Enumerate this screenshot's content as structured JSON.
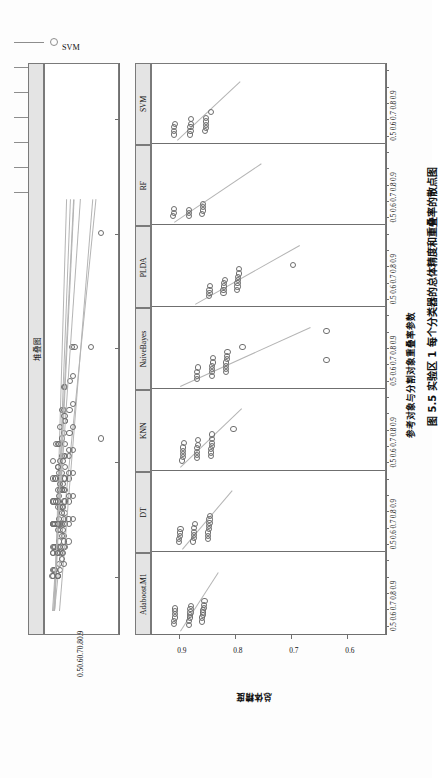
{
  "figure": {
    "caption": "图 5.5  实验区 1 每个分类器的总体精度和重叠率的散点图",
    "xlabel": "参考对象与分割对象重叠率参数",
    "ylabel": "总体精度"
  },
  "legend": {
    "title": "图例",
    "items": [
      {
        "label": "Adaboost.M1",
        "color": "#8d8d8d"
      },
      {
        "label": "DT",
        "color": "#8d8d8d"
      },
      {
        "label": "KNN",
        "color": "#8d8d8d"
      },
      {
        "label": "NaiveBayes",
        "color": "#8d8d8d"
      },
      {
        "label": "PLDA",
        "color": "#8d8d8d"
      },
      {
        "label": "RF",
        "color": "#8d8d8d"
      },
      {
        "label": "SVM",
        "color": "#8d8d8d"
      }
    ]
  },
  "top_panel": {
    "strip_label": "堆叠图",
    "axis_ticks": [
      "0.5",
      "0.6",
      "0.7",
      "0.8",
      "0.9"
    ]
  },
  "main_panel": {
    "strip_labels": [
      "Adaboost.M1",
      "DT",
      "KNN",
      "NaiveBayes",
      "PLDA",
      "RF",
      "SVM"
    ],
    "group_tick_text": "0.50.60.70.80.9",
    "y_ticks": [
      "0.9",
      "0.8",
      "0.7",
      "0.6"
    ]
  },
  "chart_data": {
    "type": "scatter",
    "title": "图 5.5  实验区 1 每个分类器的总体精度和重叠率的散点图",
    "xlabel": "参考对象与分割对象重叠率参数",
    "ylabel": "总体精度",
    "xlim": [
      0.45,
      0.95
    ],
    "ylim": [
      0.53,
      0.95
    ],
    "x_ticks": [
      0.5,
      0.6,
      0.7,
      0.8,
      0.9
    ],
    "y_ticks": [
      0.9,
      0.8,
      0.7,
      0.6
    ],
    "grid": false,
    "legend_position": "top-right",
    "panels": [
      "Adaboost.M1",
      "DT",
      "KNN",
      "NaiveBayes",
      "PLDA",
      "RF",
      "SVM"
    ],
    "stacked_panel": "堆叠图",
    "series": [
      {
        "name": "Adaboost.M1",
        "points": [
          [
            0.52,
            0.862
          ],
          [
            0.545,
            0.862
          ],
          [
            0.56,
            0.861
          ],
          [
            0.575,
            0.86
          ],
          [
            0.59,
            0.86
          ],
          [
            0.605,
            0.859
          ],
          [
            0.62,
            0.859
          ],
          [
            0.645,
            0.858
          ],
          [
            0.5,
            0.885
          ],
          [
            0.525,
            0.885
          ],
          [
            0.545,
            0.884
          ],
          [
            0.56,
            0.884
          ],
          [
            0.575,
            0.883
          ],
          [
            0.595,
            0.883
          ],
          [
            0.615,
            0.882
          ],
          [
            0.505,
            0.912
          ],
          [
            0.525,
            0.912
          ],
          [
            0.545,
            0.911
          ],
          [
            0.565,
            0.911
          ],
          [
            0.585,
            0.91
          ],
          [
            0.6,
            0.91
          ]
        ]
      },
      {
        "name": "DT",
        "points": [
          [
            0.525,
            0.852
          ],
          [
            0.545,
            0.851
          ],
          [
            0.565,
            0.851
          ],
          [
            0.585,
            0.85
          ],
          [
            0.605,
            0.85
          ],
          [
            0.625,
            0.849
          ],
          [
            0.645,
            0.849
          ],
          [
            0.665,
            0.848
          ],
          [
            0.51,
            0.878
          ],
          [
            0.53,
            0.877
          ],
          [
            0.55,
            0.877
          ],
          [
            0.57,
            0.876
          ],
          [
            0.59,
            0.876
          ],
          [
            0.615,
            0.875
          ],
          [
            0.505,
            0.903
          ],
          [
            0.525,
            0.903
          ],
          [
            0.545,
            0.902
          ],
          [
            0.565,
            0.902
          ],
          [
            0.585,
            0.901
          ]
        ]
      },
      {
        "name": "KNN",
        "points": [
          [
            0.535,
            0.847
          ],
          [
            0.555,
            0.846
          ],
          [
            0.575,
            0.846
          ],
          [
            0.595,
            0.845
          ],
          [
            0.615,
            0.845
          ],
          [
            0.635,
            0.844
          ],
          [
            0.665,
            0.844
          ],
          [
            0.7,
            0.806
          ],
          [
            0.52,
            0.872
          ],
          [
            0.54,
            0.872
          ],
          [
            0.56,
            0.871
          ],
          [
            0.58,
            0.871
          ],
          [
            0.6,
            0.87
          ],
          [
            0.63,
            0.87
          ],
          [
            0.505,
            0.898
          ],
          [
            0.525,
            0.897
          ],
          [
            0.545,
            0.897
          ],
          [
            0.565,
            0.896
          ],
          [
            0.585,
            0.896
          ],
          [
            0.615,
            0.895
          ]
        ]
      },
      {
        "name": "NaiveBayes",
        "points": [
          [
            0.545,
            0.82
          ],
          [
            0.565,
            0.82
          ],
          [
            0.585,
            0.819
          ],
          [
            0.605,
            0.819
          ],
          [
            0.625,
            0.818
          ],
          [
            0.645,
            0.818
          ],
          [
            0.67,
            0.817
          ],
          [
            0.7,
            0.79
          ],
          [
            0.525,
            0.845
          ],
          [
            0.545,
            0.845
          ],
          [
            0.565,
            0.844
          ],
          [
            0.585,
            0.844
          ],
          [
            0.605,
            0.843
          ],
          [
            0.635,
            0.843
          ],
          [
            0.505,
            0.872
          ],
          [
            0.525,
            0.871
          ],
          [
            0.545,
            0.871
          ],
          [
            0.575,
            0.87
          ],
          [
            0.62,
            0.64
          ],
          [
            0.8,
            0.64
          ]
        ]
      },
      {
        "name": "PLDA",
        "points": [
          [
            0.55,
            0.8
          ],
          [
            0.57,
            0.799
          ],
          [
            0.59,
            0.799
          ],
          [
            0.61,
            0.798
          ],
          [
            0.63,
            0.798
          ],
          [
            0.65,
            0.797
          ],
          [
            0.675,
            0.797
          ],
          [
            0.53,
            0.824
          ],
          [
            0.55,
            0.824
          ],
          [
            0.57,
            0.823
          ],
          [
            0.59,
            0.823
          ],
          [
            0.61,
            0.822
          ],
          [
            0.7,
            0.7
          ],
          [
            0.51,
            0.85
          ],
          [
            0.53,
            0.849
          ],
          [
            0.55,
            0.849
          ],
          [
            0.575,
            0.848
          ]
        ]
      },
      {
        "name": "RF",
        "points": [
          [
            0.515,
            0.862
          ],
          [
            0.535,
            0.861
          ],
          [
            0.555,
            0.861
          ],
          [
            0.575,
            0.86
          ],
          [
            0.5,
            0.886
          ],
          [
            0.52,
            0.886
          ],
          [
            0.54,
            0.885
          ],
          [
            0.5,
            0.914
          ],
          [
            0.52,
            0.913
          ],
          [
            0.545,
            0.913
          ]
        ]
      },
      {
        "name": "SVM",
        "points": [
          [
            0.52,
            0.857
          ],
          [
            0.54,
            0.856
          ],
          [
            0.56,
            0.856
          ],
          [
            0.58,
            0.855
          ],
          [
            0.6,
            0.855
          ],
          [
            0.64,
            0.846
          ],
          [
            0.5,
            0.884
          ],
          [
            0.52,
            0.883
          ],
          [
            0.545,
            0.883
          ],
          [
            0.565,
            0.882
          ],
          [
            0.595,
            0.882
          ],
          [
            0.5,
            0.913
          ],
          [
            0.52,
            0.912
          ],
          [
            0.545,
            0.912
          ],
          [
            0.565,
            0.911
          ]
        ]
      }
    ]
  }
}
